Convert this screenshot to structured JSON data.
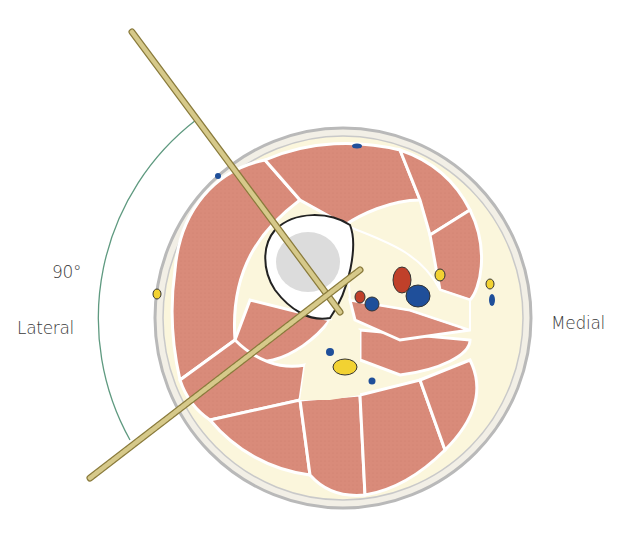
{
  "figure": {
    "type": "anatomical cross-section of thigh with pins",
    "labels": {
      "angle": "90°",
      "lateral": "Lateral",
      "medial": "Medial"
    },
    "colors": {
      "muscle": "#d98b7a",
      "fat": "#fbf6dc",
      "skin_outline": "#b9b9b9",
      "bone_cortex": "#ffffff",
      "bone_marrow": "#dcdcdc",
      "artery": "#c0402a",
      "vein": "#1f4f9a",
      "nerve": "#f2d232",
      "pin": "#d6c98a",
      "angle_arc": "#5f9a80"
    }
  }
}
